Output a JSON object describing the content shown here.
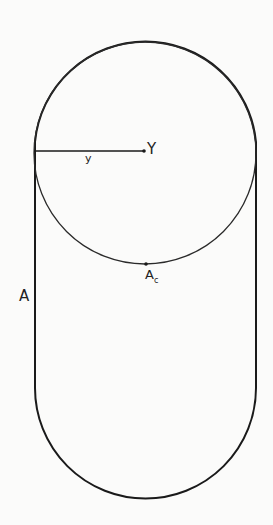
{
  "diagram": {
    "labels": {
      "center": "Y",
      "radius": "y",
      "contact_point_main": "A",
      "contact_point_sub": "c",
      "outline": "A"
    },
    "colors": {
      "stroke": "#1a1a1a",
      "background": "#fbfbfa"
    }
  }
}
